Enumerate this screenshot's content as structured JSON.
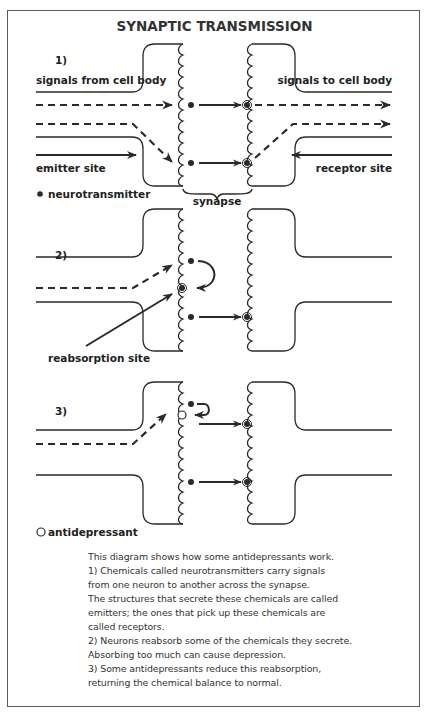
{
  "title": "SYNAPTIC TRANSMISSION",
  "panels": [
    {
      "number": "1)",
      "labels": {
        "signals_from": "signals from cell body",
        "signals_to": "signals to cell body",
        "emitter": "emitter site",
        "receptor": "receptor site"
      }
    },
    {
      "number": "2)",
      "labels": {
        "reabsorption": "reabsorption site"
      }
    },
    {
      "number": "3)",
      "labels": {}
    }
  ],
  "legend": {
    "neurotransmitter": "neurotransmitter",
    "antidepressant": "antidepressant",
    "synapse": "synapse"
  },
  "caption": {
    "lines": [
      "This diagram shows how some antidepressants work.",
      "1) Chemicals called neurotransmitters carry signals",
      "from one neuron to another across the synapse.",
      "The structures that secrete these chemicals are called",
      "emitters; the ones that pick up these chemicals are",
      "called receptors.",
      "2) Neurons reabsorb some of the chemicals they secrete.",
      "Absorbing too much can cause depression.",
      "3) Some antidepressants reduce this reabsorption,",
      "returning the chemical balance to normal."
    ]
  },
  "colors": {
    "stroke": "#2a2a2a",
    "frame": "#5a5a5a",
    "text": "#222222"
  }
}
